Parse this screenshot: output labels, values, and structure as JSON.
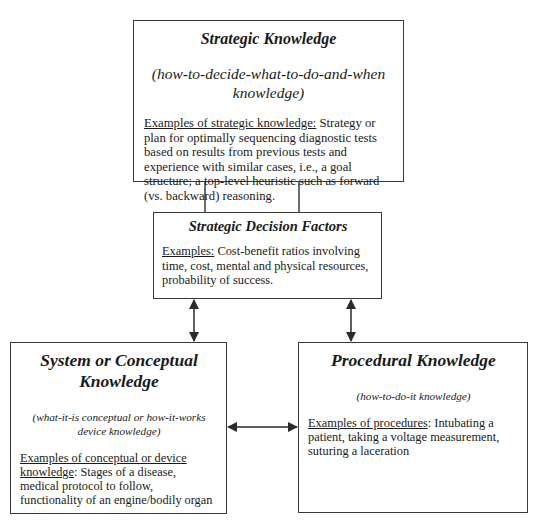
{
  "diagram": {
    "boxes": {
      "strategic_knowledge": {
        "title": "Strategic Knowledge",
        "subtitle": "(how-to-decide-what-to-do-and-when knowledge)",
        "examples_label": "Examples of strategic knowledge:",
        "examples_text": " Strategy or plan for optimally sequencing diagnostic tests based on results from previous tests and experience with similar cases, i.e., a goal structure; a top-level heuristic such as forward (vs. backward) reasoning."
      },
      "strategic_decision_factors": {
        "title": "Strategic Decision Factors",
        "examples_label": "Examples:",
        "examples_text": " Cost-benefit ratios involving time, cost, mental and physical resources, probability of success."
      },
      "system_conceptual_knowledge": {
        "title": "System or Conceptual Knowledge",
        "subtitle": "(what-it-is conceptual or how-it-works device knowledge)",
        "examples_label": "Examples of conceptual or device knowledge",
        "examples_text": ": Stages of a disease, medical protocol to follow, functionality of an engine/bodily organ"
      },
      "procedural_knowledge": {
        "title": "Procedural Knowledge",
        "subtitle": "(how-to-do-it knowledge)",
        "examples_label": "Examples of procedures",
        "examples_text": ":  Intubating a patient, taking a voltage measurement, suturing a laceration"
      }
    },
    "connections": [
      {
        "from": "strategic_knowledge",
        "to": "strategic_decision_factors",
        "type": "line"
      },
      {
        "from": "strategic_knowledge",
        "to": "strategic_decision_factors",
        "type": "line"
      },
      {
        "from": "strategic_decision_factors",
        "to": "system_conceptual_knowledge",
        "type": "double-arrow"
      },
      {
        "from": "strategic_decision_factors",
        "to": "procedural_knowledge",
        "type": "double-arrow"
      },
      {
        "from": "system_conceptual_knowledge",
        "to": "procedural_knowledge",
        "type": "double-arrow"
      }
    ],
    "line_color": "#2a2a2a"
  }
}
